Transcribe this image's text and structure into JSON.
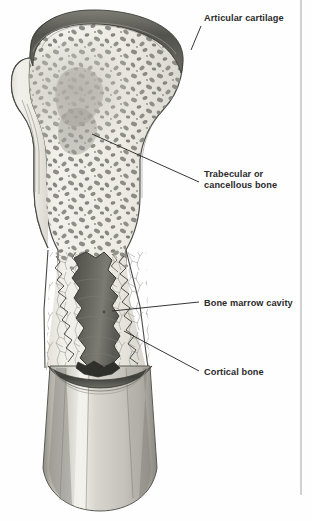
{
  "figure": {
    "width": 312,
    "height": 521,
    "background_color": "#fefefe"
  },
  "labels": [
    {
      "id": "articular-cartilage",
      "text": "Articular cartilage",
      "text_x": 204,
      "text_y": 21,
      "leader": "M 191 50 L 201 26",
      "second_line": ""
    },
    {
      "id": "trabecular-cancellous-bone",
      "text": "Trabecular or",
      "second_line": "cancellous bone",
      "text_x": 204,
      "text_y": 177,
      "leader": "M 92 134 L 199 182"
    },
    {
      "id": "bone-marrow-cavity",
      "text": "Bone marrow cavity",
      "second_line": "",
      "text_x": 204,
      "text_y": 306,
      "leader": "M 112 311 L 199 302"
    },
    {
      "id": "cortical-bone",
      "text": "Cortical bone",
      "second_line": "",
      "text_x": 204,
      "text_y": 375,
      "leader": "M 124 331 L 199 371"
    }
  ],
  "colors": {
    "cartilage": "#55554f",
    "cartilage_light": "#8e8e87",
    "trabecular_blob": "#8a8a84",
    "bone_cream": "#ebe9e2",
    "bone_cream_light": "#f4f2ec",
    "marrow_dark": "#5e5e57",
    "marrow_mid": "#767670",
    "cortical_shaft": "#c9c7c0",
    "cortical_shaft_light": "#e4e2db",
    "cortical_shaft_dark": "#a5a39c",
    "outline": "#4a4a45",
    "label_text": "#2b2b2b",
    "frame": "#9a9a9a"
  },
  "frame": {
    "right_rule_x": 301,
    "right_rule_top": 0,
    "right_rule_bottom": 495
  },
  "regions": [
    {
      "id": "epiphysis-head",
      "name": "femoral head with trabecular bone"
    },
    {
      "id": "cartilage-cap",
      "name": "articular cartilage cap"
    },
    {
      "id": "metaphysis",
      "name": "flaring metaphysis"
    },
    {
      "id": "marrow-cavity",
      "name": "medullary marrow cavity"
    },
    {
      "id": "diaphysis",
      "name": "cortical bone shaft, cut away"
    }
  ]
}
